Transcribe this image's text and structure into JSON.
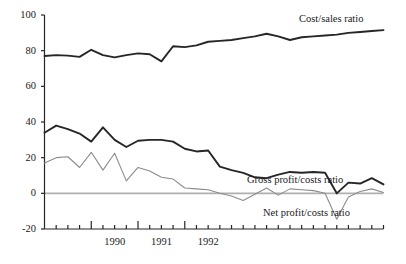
{
  "chart_data": {
    "type": "line",
    "title": "",
    "xlabel": "",
    "ylabel": "",
    "ylim": [
      -20,
      100
    ],
    "yticks": [
      100,
      80,
      60,
      40,
      20,
      0,
      -20
    ],
    "ytick_labels": [
      "100",
      "80",
      "60",
      "40",
      "20",
      "0",
      "-20"
    ],
    "xtick_labels": [
      "1990",
      "1991",
      "1992"
    ],
    "x_major_ticks": [
      "1990",
      "1991",
      "1992"
    ],
    "x_minor_tick_count_per_year": 4,
    "grid": "zero-line-only",
    "legend": "inline-annotations",
    "x": [
      "1989Q2",
      "1989Q3",
      "1989Q4",
      "1990Q1",
      "1990Q2",
      "1990Q3",
      "1990Q4",
      "1991Q1",
      "1991Q2",
      "1991Q3",
      "1991Q4",
      "1992Q1",
      "1992Q2",
      "1992Q3",
      "1992Q4",
      "1993Q1",
      "1993Q2",
      "1993Q3",
      "1993Q4",
      "1994Q1",
      "1994Q2",
      "1994Q3",
      "1994Q4",
      "1995Q1",
      "1995Q2",
      "1995Q3",
      "1995Q4",
      "1996Q1",
      "1996Q2",
      "1996Q3"
    ],
    "series": [
      {
        "name": "Cost/sales ratio",
        "color": "#262626",
        "width": 1.9,
        "values": [
          77,
          77.5,
          77.2,
          76.5,
          80.5,
          77.5,
          76.2,
          77.5,
          78.5,
          78,
          74,
          82.5,
          82,
          83,
          85,
          85.5,
          86,
          87,
          88,
          89.5,
          88,
          86,
          87.5,
          88,
          88.5,
          89,
          90,
          90.5,
          91,
          91.5
        ]
      },
      {
        "name": "Gross profit/costs ratio",
        "color": "#262626",
        "width": 1.9,
        "values": [
          34,
          38,
          36,
          33.5,
          29,
          37,
          30,
          26,
          29.5,
          30,
          30,
          29,
          25,
          23.5,
          24,
          15,
          13,
          11.5,
          9,
          8.5,
          10.5,
          12,
          11.5,
          12,
          11.5,
          0,
          6,
          5.5,
          8.5,
          5
        ]
      },
      {
        "name": "Net profit/costs ratio",
        "color": "#8c8c8c",
        "width": 1.1,
        "values": [
          17,
          20,
          20.5,
          14.5,
          23,
          13,
          22.5,
          7,
          14.5,
          12.5,
          9,
          8,
          3,
          2.5,
          2,
          0,
          -1.5,
          -4,
          -0.5,
          3,
          -1,
          2.5,
          2,
          1.5,
          0,
          -14.5,
          -2,
          1,
          2.5,
          0.5
        ]
      }
    ],
    "annotations": [
      {
        "text": "Cost/sales ratio",
        "x_px": 299,
        "y_px": 14
      },
      {
        "text": "Gross profit/costs ratio",
        "x_px": 247,
        "y_px": 175
      },
      {
        "text": "Net profit/costs ratio",
        "x_px": 263,
        "y_px": 208
      }
    ],
    "axis_colors": {
      "axis": "#262626",
      "zero_line": "#b0b0b0",
      "text": "#1a1a1a"
    }
  }
}
